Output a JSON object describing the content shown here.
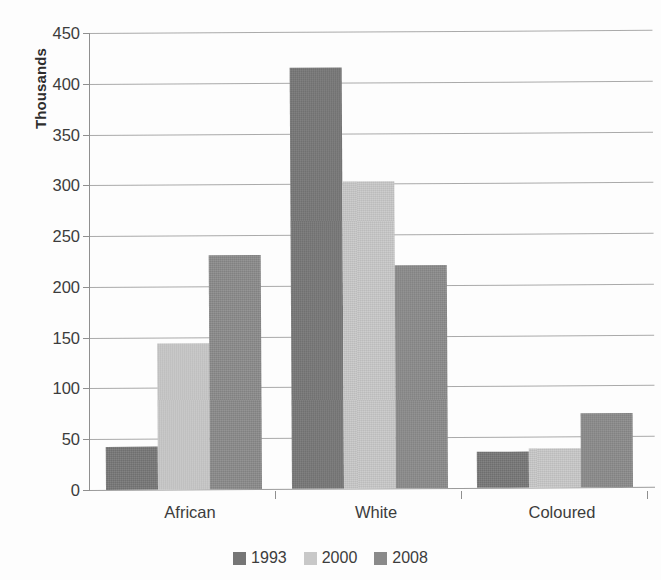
{
  "chart_data": {
    "type": "bar",
    "title": "",
    "subtitle": "",
    "xlabel": "",
    "ylabel": "Thousands",
    "categories": [
      "African",
      "White",
      "Coloured"
    ],
    "series": [
      {
        "name": "1993",
        "color": "#767676",
        "values": [
          42,
          415,
          35
        ]
      },
      {
        "name": "2000",
        "color": "#c8c8c8",
        "values": [
          144,
          302,
          38
        ]
      },
      {
        "name": "2008",
        "color": "#8a8a8a",
        "values": [
          230,
          220,
          73
        ]
      }
    ],
    "ylim": [
      0,
      450
    ],
    "ytick_step": 50,
    "ytick_labels": [
      "450",
      "400",
      "350",
      "300",
      "250",
      "200",
      "150",
      "100",
      "50",
      "0"
    ],
    "ytick_values": [
      450,
      400,
      350,
      300,
      250,
      200,
      150,
      100,
      50,
      0
    ],
    "grid": "horizontal",
    "legend_position": "bottom",
    "legend_entries": [
      "1993",
      "2000",
      "2008"
    ]
  }
}
